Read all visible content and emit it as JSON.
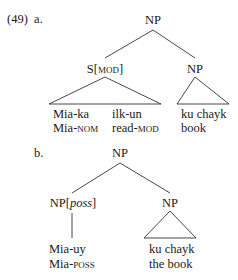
{
  "example_number": "(49)",
  "a": {
    "label": "a.",
    "root": "NP",
    "left_node": {
      "cat": "S",
      "feature": "MOD"
    },
    "right_node": "NP",
    "left_leaves": [
      {
        "word": "Mia-ka",
        "gloss_stem": "Mia-",
        "gloss_tag": "NOM"
      },
      {
        "word": "ilk-un",
        "gloss_stem": "read-",
        "gloss_tag": "MOD"
      }
    ],
    "right_leaf": {
      "word": "ku chayk",
      "gloss": "book"
    }
  },
  "b": {
    "label": "b.",
    "root": "NP",
    "left_node": {
      "cat": "NP",
      "feature": "poss"
    },
    "right_node": "NP",
    "left_leaf": {
      "word": "Mia-uy",
      "gloss_stem": "Mia-",
      "gloss_tag": "POSS"
    },
    "right_leaf": {
      "word": "ku chayk",
      "gloss": "the book"
    }
  }
}
